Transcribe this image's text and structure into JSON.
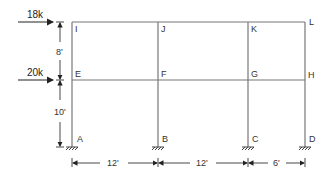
{
  "diagram": {
    "type": "multi-storey frame",
    "nodes": {
      "A": "A",
      "B": "B",
      "C": "C",
      "D": "D",
      "E": "E",
      "F": "F",
      "G": "G",
      "H": "H",
      "I": "I",
      "J": "J",
      "K": "K",
      "L": "L"
    },
    "loads": [
      {
        "label": "18k",
        "node": "I"
      },
      {
        "label": "20k",
        "node": "E"
      }
    ],
    "heights": [
      {
        "label": "8'",
        "from": "E",
        "to": "I"
      },
      {
        "label": "10'",
        "from": "A",
        "to": "E"
      }
    ],
    "spans": [
      {
        "label": "12'",
        "from": "A",
        "to": "B"
      },
      {
        "label": "12'",
        "from": "B",
        "to": "C"
      },
      {
        "label": "6'",
        "from": "C",
        "to": "D"
      }
    ],
    "colors": {
      "line": "#6b6b6b",
      "text": "#333333"
    }
  }
}
